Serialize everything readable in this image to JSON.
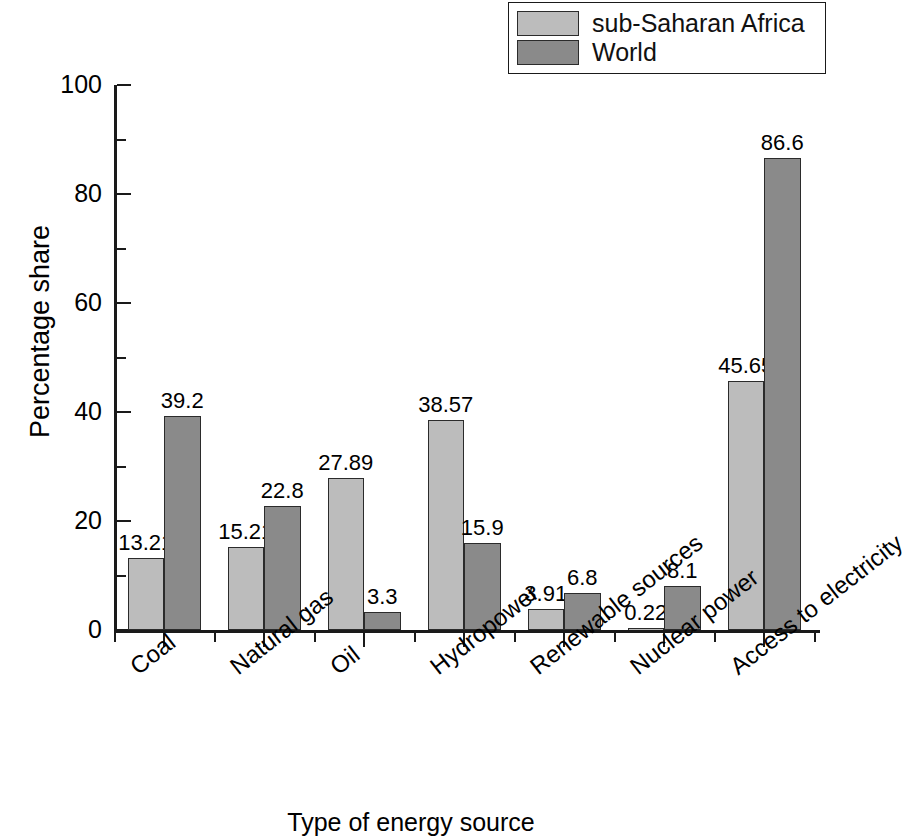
{
  "chart_data": {
    "type": "bar",
    "title": "",
    "xlabel": "Type of energy source",
    "ylabel": "Percentage share",
    "categories": [
      "Coal",
      "Natural gas",
      "Oil",
      "Hydropower",
      "Renewable sources",
      "Nuclear power",
      "Access to electricity"
    ],
    "series": [
      {
        "name": "sub-Saharan Africa",
        "color": "#bcbcbc",
        "values": [
          13.21,
          15.21,
          27.89,
          38.57,
          3.91,
          0.22,
          45.65
        ],
        "labels": [
          "13.21",
          "15.21",
          "27.89",
          "38.57",
          "3.91",
          "0.22",
          "45.65"
        ]
      },
      {
        "name": "World",
        "color": "#8a8a8a",
        "values": [
          39.2,
          22.8,
          3.3,
          15.9,
          6.8,
          8.1,
          86.6
        ],
        "labels": [
          "39.2",
          "22.8",
          "3.3",
          "15.9",
          "6.8",
          "8.1",
          "86.6"
        ]
      }
    ],
    "ylim": [
      0,
      100
    ],
    "ytick_labels": [
      "0",
      "20",
      "40",
      "60",
      "80",
      "100"
    ],
    "ytick_values": [
      0,
      20,
      40,
      60,
      80,
      100
    ],
    "yminor_values": [
      10,
      30,
      50,
      70,
      90
    ],
    "grid": false,
    "legend_position": "top-right",
    "axis_color": "#1a1a1a",
    "bar_edge_color": "#2b2b2b"
  },
  "legend": {
    "items": [
      {
        "label": "sub-Saharan Africa",
        "color": "#bcbcbc"
      },
      {
        "label": "World",
        "color": "#8a8a8a"
      }
    ]
  },
  "axes": {
    "y_title": "Percentage share",
    "x_title": "Type of energy source"
  }
}
